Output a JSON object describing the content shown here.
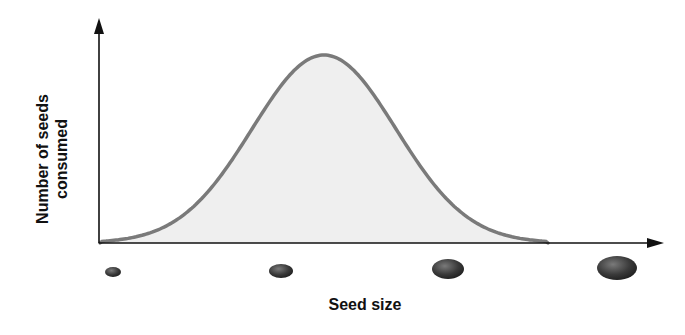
{
  "chart_data": {
    "type": "area",
    "title": "",
    "xlabel": "Seed size",
    "ylabel_lines": [
      "Number of seeds",
      "consumed"
    ],
    "distribution": "bell-shaped (normal)",
    "peak_position": "center-left (medium seed size)",
    "x_axis_icons": [
      {
        "name": "small-seed",
        "size_rank": 1
      },
      {
        "name": "medium-seed",
        "size_rank": 2
      },
      {
        "name": "large-seed",
        "size_rank": 3
      },
      {
        "name": "extra-large-seed",
        "size_rank": 4
      }
    ],
    "colors": {
      "curve": "#7a7a7a",
      "fill": "#efefef",
      "axis": "#111111",
      "seed": "#3a3a3a"
    }
  }
}
